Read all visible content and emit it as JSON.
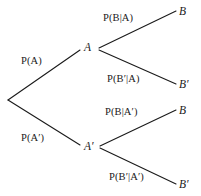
{
  "diagram": {
    "type": "probability-tree",
    "background_color": "#ffffff",
    "line_color": "#1a1a1a",
    "text_color": "#1a1a1a"
  },
  "nodes": {
    "root": {
      "label": "",
      "x": 8,
      "y": 100
    },
    "a": {
      "label": "A",
      "x": 89,
      "y": 48
    },
    "a_prime": {
      "label": "A′",
      "x": 89,
      "y": 147
    },
    "b_top": {
      "label": "B",
      "x": 183,
      "y": 12
    },
    "b_prime_upper": {
      "label": "B′",
      "x": 183,
      "y": 85
    },
    "b_lower": {
      "label": "B",
      "x": 183,
      "y": 111
    },
    "b_prime_bottom": {
      "label": "B′",
      "x": 183,
      "y": 185
    }
  },
  "edge_labels": {
    "p_a": "P(A)",
    "p_a_prime": "P(A′)",
    "p_b_given_a": "P(B|A)",
    "p_b_prime_given_a": "P(B′|A)",
    "p_b_given_a_prime": "P(B|A′)",
    "p_b_prime_given_a_prime": "P(B′|A′)"
  },
  "edges": [
    {
      "name": "root-to-a",
      "from": "root",
      "to": "a",
      "label_key": "p_a"
    },
    {
      "name": "root-to-a-prime",
      "from": "root",
      "to": "a_prime",
      "label_key": "p_a_prime"
    },
    {
      "name": "a-to-b",
      "from": "a",
      "to": "b_top",
      "label_key": "p_b_given_a"
    },
    {
      "name": "a-to-b-prime",
      "from": "a",
      "to": "b_prime_upper",
      "label_key": "p_b_prime_given_a"
    },
    {
      "name": "a-prime-to-b",
      "from": "a_prime",
      "to": "b_lower",
      "label_key": "p_b_given_a_prime"
    },
    {
      "name": "a-prime-to-b-prime",
      "from": "a_prime",
      "to": "b_prime_bottom",
      "label_key": "p_b_prime_given_a_prime"
    }
  ]
}
